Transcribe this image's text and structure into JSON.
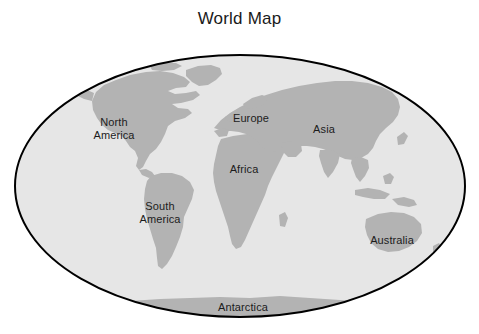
{
  "figure": {
    "title": "World Map",
    "background_color": "#ffffff",
    "width": 479,
    "height": 334
  },
  "globe": {
    "name": "world-ellipse",
    "projection": "mollweide-oval",
    "ocean_color": "#e6e6e6",
    "land_color": "#b3b3b3",
    "outline_color": "#000000",
    "outline_width": 2,
    "center_x": 240,
    "center_y": 186,
    "radius_x": 226,
    "radius_y": 132
  },
  "labels": [
    {
      "id": "north-america",
      "text": "North\nAmerica",
      "x": 114,
      "y": 128
    },
    {
      "id": "south-america",
      "text": "South\nAmerica",
      "x": 160,
      "y": 212
    },
    {
      "id": "europe",
      "text": "Europe",
      "x": 251,
      "y": 118
    },
    {
      "id": "asia",
      "text": "Asia",
      "x": 324,
      "y": 129
    },
    {
      "id": "africa",
      "text": "Africa",
      "x": 244,
      "y": 169
    },
    {
      "id": "australia",
      "text": "Australia",
      "x": 392,
      "y": 240
    },
    {
      "id": "antarctica",
      "text": "Antarctica",
      "x": 243,
      "y": 307
    }
  ],
  "colors": {
    "land": "#b3b3b3",
    "ocean": "#e6e6e6",
    "outline": "#000000",
    "text": "#1c1c1c",
    "page": "#ffffff"
  }
}
